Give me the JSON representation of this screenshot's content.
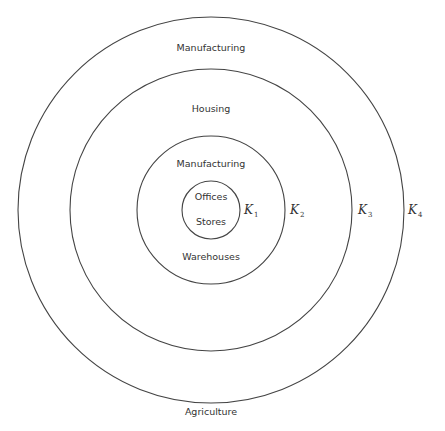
{
  "diagram": {
    "type": "concentric-zone-model",
    "center": {
      "x": 211,
      "y": 210
    },
    "rings": [
      {
        "id": "K1",
        "letter": "K",
        "sub": "1",
        "radius": 29,
        "label_x": 244,
        "label_y": 214
      },
      {
        "id": "K2",
        "letter": "K",
        "sub": "2",
        "radius": 74,
        "label_x": 290,
        "label_y": 214
      },
      {
        "id": "K3",
        "letter": "K",
        "sub": "3",
        "radius": 141,
        "label_x": 358,
        "label_y": 214
      },
      {
        "id": "K4",
        "letter": "K",
        "sub": "4",
        "radius": 193,
        "label_x": 408,
        "label_y": 214
      }
    ],
    "zones": {
      "core_top": {
        "text": "Offices",
        "x": 211,
        "y": 200
      },
      "core_bottom": {
        "text": "Stores",
        "x": 211,
        "y": 225
      },
      "zone2_top": {
        "text": "Manufacturing",
        "x": 211,
        "y": 167
      },
      "zone2_bottom": {
        "text": "Warehouses",
        "x": 211,
        "y": 260
      },
      "zone3_top": {
        "text": "Housing",
        "x": 211,
        "y": 112
      },
      "zone4_top": {
        "text": "Manufacturing",
        "x": 211,
        "y": 51
      },
      "outside_bottom": {
        "text": "Agriculture",
        "x": 211,
        "y": 415
      }
    },
    "stroke_color": "#444444",
    "text_color": "#333333"
  }
}
